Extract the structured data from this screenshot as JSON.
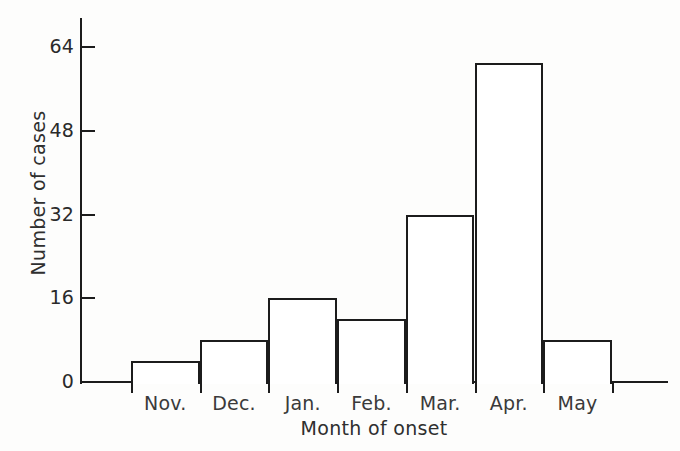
{
  "chart_data": {
    "type": "bar",
    "title": "",
    "xlabel": "Month of onset",
    "ylabel": "Number of cases",
    "categories": [
      "Nov.",
      "Dec.",
      "Jan.",
      "Feb.",
      "Mar.",
      "Apr.",
      "May"
    ],
    "values": [
      4,
      8,
      16,
      12,
      32,
      61,
      8
    ],
    "yticks": [
      0,
      16,
      32,
      48,
      64
    ],
    "ytick_labels": [
      "0",
      "16",
      "32",
      "48",
      "64"
    ],
    "ylim": [
      0,
      69
    ],
    "grid": false,
    "legend": null,
    "style": {
      "bar_fill": "#ffffff",
      "bar_stroke": "#1c1c1c",
      "axis_color": "#1c1c1c",
      "text_color": "#2f2f2f",
      "background": "#fdfdfc"
    }
  }
}
